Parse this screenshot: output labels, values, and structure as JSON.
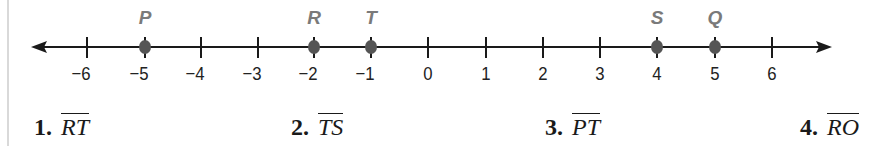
{
  "number_line": {
    "x_min": -6,
    "x_max": 6,
    "arrows": "both",
    "ticks": [
      {
        "value": -6,
        "label": "−6",
        "x": 87
      },
      {
        "value": -5,
        "label": "−5",
        "x": 145
      },
      {
        "value": -4,
        "label": "−4",
        "x": 201
      },
      {
        "value": -3,
        "label": "−3",
        "x": 258
      },
      {
        "value": -2,
        "label": "−2",
        "x": 314
      },
      {
        "value": -1,
        "label": "−1",
        "x": 371
      },
      {
        "value": 0,
        "label": "0",
        "x": 428
      },
      {
        "value": 1,
        "label": "1",
        "x": 486
      },
      {
        "value": 2,
        "label": "2",
        "x": 543
      },
      {
        "value": 3,
        "label": "3",
        "x": 600
      },
      {
        "value": 4,
        "label": "4",
        "x": 657
      },
      {
        "value": 5,
        "label": "5",
        "x": 715
      },
      {
        "value": 6,
        "label": "6",
        "x": 772
      }
    ],
    "points": [
      {
        "name": "P",
        "value": -5
      },
      {
        "name": "R",
        "value": -2
      },
      {
        "name": "T",
        "value": -1
      },
      {
        "name": "S",
        "value": 4
      },
      {
        "name": "Q",
        "value": 5
      }
    ],
    "point_label_color": "#7a7a7a",
    "point_dot_color": "#555555"
  },
  "problems": [
    {
      "number": "1.",
      "segment": "RT"
    },
    {
      "number": "2.",
      "segment": "TS"
    },
    {
      "number": "3.",
      "segment": "PT"
    },
    {
      "number": "4.",
      "segment": "RO"
    }
  ]
}
